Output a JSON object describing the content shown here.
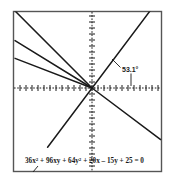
{
  "figure": {
    "frame": {
      "x": 13.5,
      "y": 11.5,
      "width": 148,
      "height": 160,
      "stroke": "#555555",
      "fill": "#ffffff"
    },
    "origin": {
      "x": 92,
      "y": 88
    },
    "axes": {
      "x_axis": {
        "x1": 14,
        "y1": 88,
        "x2": 161,
        "y2": 88
      },
      "y_axis": {
        "x1": 92,
        "y1": 12,
        "x2": 92,
        "y2": 171
      },
      "tick_spacing": 6,
      "tick_length": 3,
      "stroke": "#1a1a1a",
      "dash": "1.6 1.6"
    },
    "angle_label": {
      "text": "53.1°",
      "x": 122,
      "y": 72,
      "leader_to_line": {
        "x1": 120.5,
        "y1": 67.5,
        "x2": 112,
        "y2": 59
      },
      "leader_to_axis": {
        "x1": 131,
        "y1": 73.5,
        "x2": 131,
        "y2": 86
      }
    },
    "equation": {
      "parts": [
        {
          "t": "36x",
          "sup": false
        },
        {
          "t": "2",
          "sup": true
        },
        {
          "t": " + 96xy + 64y",
          "sup": false
        },
        {
          "t": "2",
          "sup": true
        },
        {
          "t": " + 20x – 15y + 25 = 0",
          "sup": false
        }
      ],
      "plain": "36x² + 96xy + 64y² + 20x – 15y + 25 = 0",
      "x": 25,
      "y": 163,
      "leader": {
        "x1": 38,
        "y1": 166,
        "x2": 33,
        "y2": 172
      }
    },
    "colors": {
      "ink": "#1a1a1a",
      "frame": "#555555",
      "background": "#ffffff"
    }
  },
  "chart_data": {
    "type": "line",
    "subtitle": "Degenerate conic: parallel line pair, rotated 53.1°",
    "xlabel": "x",
    "ylabel": "y",
    "xlim": [
      -13,
      12
    ],
    "ylim": [
      -14,
      13
    ],
    "grid": false,
    "legend": null,
    "annotations": [
      {
        "text": "53.1°",
        "x": 5,
        "y": 2.7,
        "note": "angle of rotation of axes"
      },
      {
        "text": "36x² + 96xy + 64y² + 20x – 15y + 25 = 0",
        "x": -11,
        "y": -12.5
      }
    ],
    "series": [
      {
        "name": "asymptote-line-1",
        "comment": "upper steep line through origin from top-left edge",
        "points": [
          [
            -13.0,
            13.0
          ],
          [
            0,
            0
          ]
        ]
      },
      {
        "name": "asymptote-line-2",
        "comment": "middle line from left edge toward origin",
        "points": [
          [
            -13.0,
            8.0
          ],
          [
            0,
            0
          ]
        ]
      },
      {
        "name": "asymptote-line-3",
        "comment": "lower line from left edge toward origin",
        "points": [
          [
            -13.0,
            5.0
          ],
          [
            0,
            0
          ]
        ]
      },
      {
        "name": "rotated-axis-line",
        "comment": "line at 53.1 degrees through origin, slope 4/3",
        "points": [
          [
            -7.5,
            -10.0
          ],
          [
            11.6,
            15.4
          ]
        ]
      },
      {
        "name": "perpendicular-line",
        "comment": "line descending to the right from origin, slope -3/4",
        "points": [
          [
            0,
            0
          ],
          [
            11.6,
            -8.7
          ]
        ]
      }
    ]
  }
}
